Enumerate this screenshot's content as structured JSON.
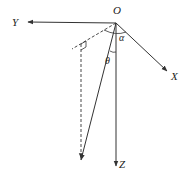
{
  "diagram": {
    "type": "3d-coordinate-vector-diagram",
    "colors": {
      "line": "#333333",
      "text": "#222222",
      "background": "#ffffff"
    },
    "origin": {
      "label": "O",
      "x": 116,
      "y": 23
    },
    "axes": [
      {
        "id": "Y",
        "label": "Y",
        "direction": "left"
      },
      {
        "id": "X",
        "label": "X",
        "direction": "down-right"
      },
      {
        "id": "Z",
        "label": "Z",
        "direction": "down"
      }
    ],
    "angles": [
      {
        "label": "α",
        "between": [
          "projection",
          "X"
        ]
      },
      {
        "label": "θ",
        "between": [
          "vector",
          "Z"
        ]
      }
    ],
    "elements": {
      "vector": "solid arrow from O",
      "projection": "dashed line from O in XY plane",
      "drop_line": "dashed vertical with right-angle marker"
    }
  }
}
